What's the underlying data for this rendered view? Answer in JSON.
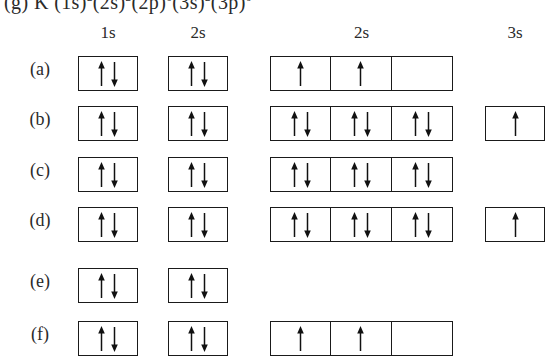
{
  "header_line": {
    "prefix": "(g) K",
    "config": "(1s)2(2s)2(2p)6(3s)2(3p)6",
    "parts": [
      {
        "base": "(1s)",
        "sup": "2"
      },
      {
        "base": "(2s)",
        "sup": "2"
      },
      {
        "base": "(2p)",
        "sup": "6"
      },
      {
        "base": "(3s)",
        "sup": "2"
      },
      {
        "base": "(3p)",
        "sup": "6"
      }
    ]
  },
  "columns": [
    {
      "name": "col-1s",
      "label": "1s",
      "left": 78,
      "width": 60
    },
    {
      "name": "col-2s",
      "label": "2s",
      "left": 168,
      "width": 60
    },
    {
      "name": "col-2p",
      "label": "2s",
      "left": 270,
      "width": 183
    },
    {
      "name": "col-3s",
      "label": "3s",
      "left": 485,
      "width": 60
    }
  ],
  "rows": [
    {
      "label": "(a)",
      "name": "row-a",
      "top": 51,
      "orbitals": {
        "s1": "up-down",
        "s2": "up-down",
        "p2": [
          "up",
          "up",
          "empty"
        ],
        "s3": null
      }
    },
    {
      "label": "(b)",
      "name": "row-b",
      "top": 101,
      "orbitals": {
        "s1": "up-down",
        "s2": "up-down",
        "p2": [
          "up-down",
          "up-down",
          "up-down"
        ],
        "s3": "up"
      }
    },
    {
      "label": "(c)",
      "name": "row-c",
      "top": 152,
      "orbitals": {
        "s1": "up-down",
        "s2": "up-down",
        "p2": [
          "up-down",
          "up-down",
          "up-down"
        ],
        "s3": null
      }
    },
    {
      "label": "(d)",
      "name": "row-d",
      "top": 202,
      "orbitals": {
        "s1": "up-down",
        "s2": "up-down",
        "p2": [
          "up-down",
          "up-down",
          "up-down"
        ],
        "s3": "up"
      }
    },
    {
      "label": "(e)",
      "name": "row-e",
      "top": 263,
      "orbitals": {
        "s1": "up-down",
        "s2": "up-down",
        "p2": null,
        "s3": null
      }
    },
    {
      "label": "(f)",
      "name": "row-f",
      "top": 316,
      "orbitals": {
        "s1": "up-down",
        "s2": "up-down",
        "p2": [
          "up",
          "up",
          "empty"
        ],
        "s3": null
      }
    }
  ],
  "colors": {
    "ink": "#1a1a1a",
    "background": "#ffffff"
  }
}
